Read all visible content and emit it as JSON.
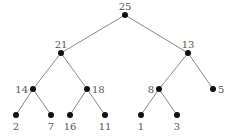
{
  "diagram": {
    "type": "binary-tree",
    "colors": {
      "edge": "#7a7a7a",
      "node": "#111111",
      "label": "#555555"
    },
    "nodes": [
      {
        "id": "n25",
        "label": "25",
        "x": 125,
        "y": 15,
        "lx": 125,
        "ly": 10,
        "anchor": "middle"
      },
      {
        "id": "n21",
        "label": "21",
        "x": 61,
        "y": 53,
        "lx": 61,
        "ly": 48,
        "anchor": "middle"
      },
      {
        "id": "n13",
        "label": "13",
        "x": 188,
        "y": 53,
        "lx": 188,
        "ly": 48,
        "anchor": "middle"
      },
      {
        "id": "n14",
        "label": "14",
        "x": 33,
        "y": 89,
        "lx": 28,
        "ly": 93,
        "anchor": "end"
      },
      {
        "id": "n18",
        "label": "18",
        "x": 87,
        "y": 89,
        "lx": 92,
        "ly": 93,
        "anchor": "start"
      },
      {
        "id": "n8",
        "label": "8",
        "x": 159,
        "y": 89,
        "lx": 154,
        "ly": 93,
        "anchor": "end"
      },
      {
        "id": "n5",
        "label": "5",
        "x": 213,
        "y": 89,
        "lx": 218,
        "ly": 93,
        "anchor": "start"
      },
      {
        "id": "n2",
        "label": "2",
        "x": 16,
        "y": 115,
        "lx": 16,
        "ly": 130,
        "anchor": "middle"
      },
      {
        "id": "n7",
        "label": "7",
        "x": 51,
        "y": 115,
        "lx": 51,
        "ly": 130,
        "anchor": "middle"
      },
      {
        "id": "n16",
        "label": "16",
        "x": 70,
        "y": 115,
        "lx": 70,
        "ly": 130,
        "anchor": "middle"
      },
      {
        "id": "n11",
        "label": "11",
        "x": 105,
        "y": 115,
        "lx": 105,
        "ly": 130,
        "anchor": "middle"
      },
      {
        "id": "n1",
        "label": "1",
        "x": 141,
        "y": 115,
        "lx": 141,
        "ly": 130,
        "anchor": "middle"
      },
      {
        "id": "n3",
        "label": "3",
        "x": 177,
        "y": 115,
        "lx": 177,
        "ly": 130,
        "anchor": "middle"
      }
    ],
    "edges": [
      [
        "n25",
        "n21"
      ],
      [
        "n25",
        "n13"
      ],
      [
        "n21",
        "n14"
      ],
      [
        "n21",
        "n18"
      ],
      [
        "n13",
        "n8"
      ],
      [
        "n13",
        "n5"
      ],
      [
        "n14",
        "n2"
      ],
      [
        "n14",
        "n7"
      ],
      [
        "n18",
        "n16"
      ],
      [
        "n18",
        "n11"
      ],
      [
        "n8",
        "n1"
      ],
      [
        "n8",
        "n3"
      ]
    ]
  }
}
